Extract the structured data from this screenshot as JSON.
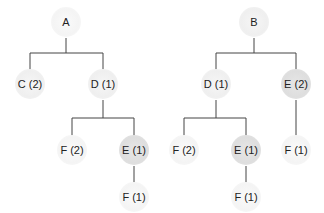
{
  "trees": [
    {
      "root": "A",
      "nodes": [
        {
          "id": "A",
          "label": "A",
          "x": 66,
          "y": 22,
          "shade": "vlight"
        },
        {
          "id": "C",
          "label": "C (2)",
          "x": 30,
          "y": 84,
          "shade": "light"
        },
        {
          "id": "D",
          "label": "D (1)",
          "x": 103,
          "y": 84,
          "shade": "light"
        },
        {
          "id": "F2",
          "label": "F (2)",
          "x": 72,
          "y": 150,
          "shade": "vlight"
        },
        {
          "id": "E1",
          "label": "E (1)",
          "x": 134,
          "y": 150,
          "shade": "mid"
        },
        {
          "id": "F1",
          "label": "F (1)",
          "x": 134,
          "y": 197,
          "shade": "vlight"
        }
      ],
      "edges": [
        [
          "A",
          "C"
        ],
        [
          "A",
          "D"
        ],
        [
          "D",
          "F2"
        ],
        [
          "D",
          "E1"
        ],
        [
          "E1",
          "F1"
        ]
      ]
    },
    {
      "root": "B",
      "nodes": [
        {
          "id": "B",
          "label": "B",
          "x": 254,
          "y": 22,
          "shade": "light"
        },
        {
          "id": "D",
          "label": "D (1)",
          "x": 216,
          "y": 84,
          "shade": "light"
        },
        {
          "id": "E2",
          "label": "E (2)",
          "x": 296,
          "y": 84,
          "shade": "mid"
        },
        {
          "id": "F2",
          "label": "F (2)",
          "x": 184,
          "y": 150,
          "shade": "vlight"
        },
        {
          "id": "E1",
          "label": "E (1)",
          "x": 246,
          "y": 150,
          "shade": "mid"
        },
        {
          "id": "F1r",
          "label": "F (1)",
          "x": 296,
          "y": 150,
          "shade": "vlight"
        },
        {
          "id": "F1b",
          "label": "F (1)",
          "x": 246,
          "y": 197,
          "shade": "vlight"
        }
      ],
      "edges": [
        [
          "B",
          "D"
        ],
        [
          "B",
          "E2"
        ],
        [
          "D",
          "F2"
        ],
        [
          "D",
          "E1"
        ],
        [
          "E2",
          "F1r"
        ],
        [
          "E1",
          "F1b"
        ]
      ]
    }
  ],
  "colors": {
    "line": "#444444",
    "text": "#222222"
  }
}
